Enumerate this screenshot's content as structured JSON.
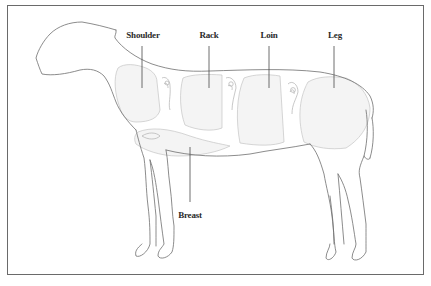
{
  "diagram": {
    "colors": {
      "outline": "#6e6e6e",
      "cut_fill": "#f4f4f4",
      "cut_stroke": "#bdbdbd",
      "leader": "#4a4a4a",
      "label": "#2a2a2a",
      "frame": "#6a6a6a"
    },
    "labels": [
      {
        "id": "shoulder",
        "text": "Shoulder",
        "x": 143,
        "y": 30
      },
      {
        "id": "rack",
        "text": "Rack",
        "x": 209,
        "y": 30
      },
      {
        "id": "loin",
        "text": "Loin",
        "x": 269,
        "y": 30
      },
      {
        "id": "leg",
        "text": "Leg",
        "x": 335,
        "y": 30
      },
      {
        "id": "breast",
        "text": "Breast",
        "x": 190,
        "y": 210
      }
    ]
  }
}
